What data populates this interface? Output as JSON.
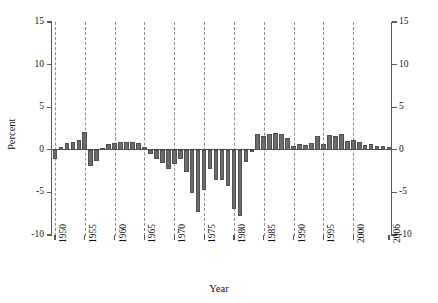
{
  "chart_data": {
    "type": "bar",
    "title": "",
    "xlabel": "Year",
    "ylabel": "Percent",
    "ylim": [
      -10,
      15
    ],
    "xlim": [
      1949.5,
      2006.5
    ],
    "grid": "vertical dashed gridlines every 5 years",
    "legend": "none",
    "bar_color": "#6c6c6c",
    "y_ticks": [
      15,
      10,
      5,
      0,
      -5,
      -10
    ],
    "y_tick_labels_left": [
      "15",
      "10",
      "5",
      "0",
      "-5",
      "-10"
    ],
    "y_tick_labels_right": [
      "15",
      "10",
      "5",
      "0",
      "-5",
      "-10"
    ],
    "x_ticks": [
      1950,
      1955,
      1960,
      1965,
      1970,
      1975,
      1980,
      1985,
      1990,
      1995,
      2000,
      2006
    ],
    "x_tick_labels": [
      "1950",
      "1955",
      "1960",
      "1965",
      "1970",
      "1975",
      "1980",
      "1985",
      "1990",
      "1995",
      "2000",
      "2006"
    ],
    "categories": [
      1950,
      1951,
      1952,
      1953,
      1954,
      1955,
      1956,
      1957,
      1958,
      1959,
      1960,
      1961,
      1962,
      1963,
      1964,
      1965,
      1966,
      1967,
      1968,
      1969,
      1970,
      1971,
      1972,
      1973,
      1974,
      1975,
      1976,
      1977,
      1978,
      1979,
      1980,
      1981,
      1982,
      1983,
      1984,
      1985,
      1986,
      1987,
      1988,
      1989,
      1990,
      1991,
      1992,
      1993,
      1994,
      1995,
      1996,
      1997,
      1998,
      1999,
      2000,
      2001,
      2002,
      2003,
      2004,
      2005,
      2006
    ],
    "values": [
      -1.1,
      0.3,
      0.8,
      0.9,
      1.1,
      2.1,
      -1.9,
      -1.3,
      0.2,
      0.7,
      0.8,
      0.9,
      0.9,
      0.9,
      0.8,
      0.3,
      -0.5,
      -1.1,
      -1.5,
      -2.2,
      -1.7,
      -1.1,
      -2.6,
      -5.1,
      -7.3,
      -4.7,
      -2.3,
      -3.5,
      -3.6,
      -4.2,
      -7.0,
      -7.8,
      -1.4,
      -0.3,
      1.9,
      1.6,
      1.8,
      2.0,
      1.9,
      1.4,
      0.4,
      0.7,
      0.6,
      0.8,
      1.6,
      0.7,
      1.7,
      1.6,
      1.9,
      1.0,
      1.2,
      0.9,
      0.6,
      0.7,
      0.5,
      0.4,
      0.3
    ]
  },
  "axis": {
    "y_title": "Percent",
    "x_title": "Year"
  }
}
